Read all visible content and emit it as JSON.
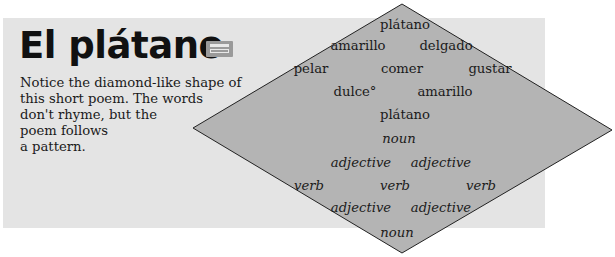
{
  "title": "El plátano",
  "cassette_icon": "cassette-tape-icon",
  "intro_lines": [
    "Notice the diamond-like shape of",
    "this short poem. The words",
    "don't rhyme, but the",
    "poem follows",
    "a pattern."
  ],
  "colors": {
    "panel_bg": "#e4e4e4",
    "diamond_fill": "#b4b4b4",
    "diamond_stroke": "#222222",
    "text": "#1a1a1a"
  },
  "poem": {
    "rows": [
      {
        "words": [
          "plátano"
        ]
      },
      {
        "words": [
          "amarillo",
          "delgado"
        ]
      },
      {
        "words": [
          "pelar",
          "comer",
          "gustar"
        ]
      },
      {
        "words": [
          "dulce°",
          "amarillo"
        ]
      },
      {
        "words": [
          "plátano"
        ]
      }
    ]
  },
  "pattern": {
    "rows": [
      {
        "words": [
          "noun"
        ]
      },
      {
        "words": [
          "adjective",
          "adjective"
        ]
      },
      {
        "words": [
          "verb",
          "verb",
          "verb"
        ]
      },
      {
        "words": [
          "adjective",
          "adjective"
        ]
      },
      {
        "words": [
          "noun"
        ]
      }
    ]
  }
}
